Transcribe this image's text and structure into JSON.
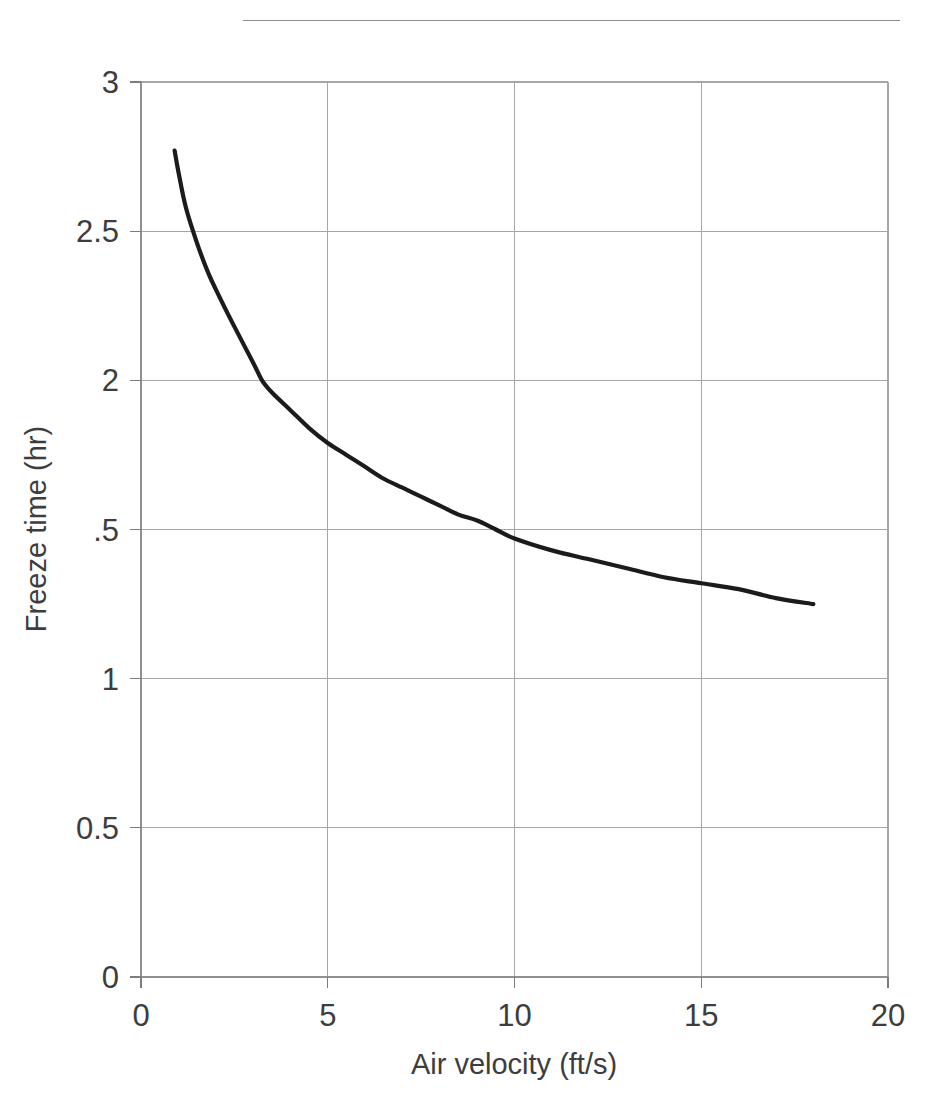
{
  "page": {
    "background_color": "#ffffff",
    "header_rule": {
      "name": "horizontal-rule",
      "color": "#8c8c8c"
    }
  },
  "chart_data": {
    "type": "line",
    "title": "",
    "subtitle": "",
    "xlabel": "Air velocity (ft/s)",
    "ylabel": "Freeze time (hr)",
    "xlim": [
      0,
      20
    ],
    "ylim": [
      0,
      3
    ],
    "xticks": [
      0,
      5,
      10,
      15,
      20
    ],
    "xticklabels": [
      "0",
      "5",
      "10",
      "15",
      "20"
    ],
    "yticks": [
      0,
      0.5,
      1,
      1.5,
      2,
      2.5,
      3
    ],
    "yticklabels": [
      "0",
      "0.5",
      "1",
      ".5",
      "2",
      "2.5",
      "3"
    ],
    "grid": true,
    "grid_color": "#a6a6a6",
    "legend": false,
    "legend_position": "none",
    "line_color": "#1b1b1b",
    "series": [
      {
        "name": "Freeze time vs air velocity",
        "x": [
          0.9,
          1.0,
          1.2,
          1.5,
          1.8,
          2.1,
          2.5,
          3.0,
          3.24,
          3.5,
          4.0,
          4.5,
          5.0,
          5.5,
          6.0,
          6.5,
          7.0,
          7.5,
          8.0,
          8.5,
          9.0,
          9.5,
          10.0,
          11.0,
          12.0,
          13.0,
          14.0,
          15.0,
          16.0,
          17.0,
          18.0
        ],
        "y": [
          2.77,
          2.7,
          2.58,
          2.46,
          2.36,
          2.28,
          2.18,
          2.06,
          2.0,
          1.96,
          1.9,
          1.84,
          1.79,
          1.75,
          1.71,
          1.67,
          1.64,
          1.61,
          1.58,
          1.55,
          1.53,
          1.5,
          1.47,
          1.43,
          1.4,
          1.37,
          1.34,
          1.32,
          1.3,
          1.27,
          1.25
        ]
      }
    ]
  }
}
